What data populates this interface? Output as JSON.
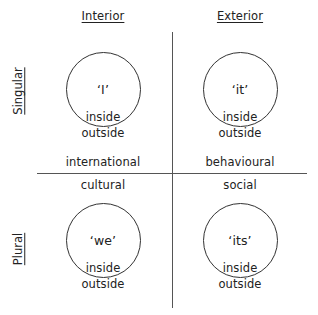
{
  "columns": {
    "interior": "Interior",
    "exterior": "Exterior"
  },
  "rows": {
    "singular": "Singular",
    "plural": "Plural"
  },
  "quadrants": [
    {
      "id": "upper-left",
      "pronoun": "‘I’",
      "inner": "inside",
      "outer": "outside"
    },
    {
      "id": "upper-right",
      "pronoun": "‘it’",
      "inner": "inside",
      "outer": "outside"
    },
    {
      "id": "lower-left",
      "pronoun": "‘we’",
      "inner": "inside",
      "outer": "outside"
    },
    {
      "id": "lower-right",
      "pronoun": "‘its’",
      "inner": "inside",
      "outer": "outside"
    }
  ],
  "axis_labels": {
    "upper_left": "international",
    "upper_right": "behavioural",
    "lower_left": "cultural",
    "lower_right": "social"
  }
}
